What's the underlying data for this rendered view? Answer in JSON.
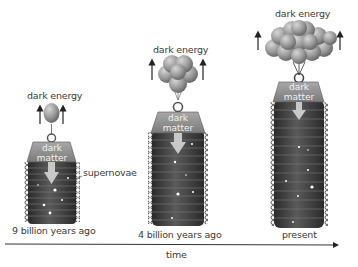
{
  "diagram": {
    "type": "illustration",
    "panels": [
      {
        "time_label": "9 billion years ago",
        "force_label": "dark energy",
        "weight_label_line1": "dark",
        "weight_label_line2": "matter",
        "balloon_count": 1,
        "annotation": "supernovae"
      },
      {
        "time_label": "4 billion years ago",
        "force_label": "dark energy",
        "weight_label_line1": "dark",
        "weight_label_line2": "matter",
        "balloon_count": 6
      },
      {
        "time_label": "present",
        "force_label": "dark energy",
        "weight_label_line1": "dark",
        "weight_label_line2": "matter",
        "balloon_count": 14
      }
    ],
    "axis": {
      "label": "time",
      "direction": "left-to-right"
    },
    "colors": {
      "balloon": "#9a9a9a",
      "weight": "#8c8c8c",
      "spring_body": "#3c3c3c",
      "coil": "#6b6b6b",
      "arrow": "#222222"
    }
  }
}
